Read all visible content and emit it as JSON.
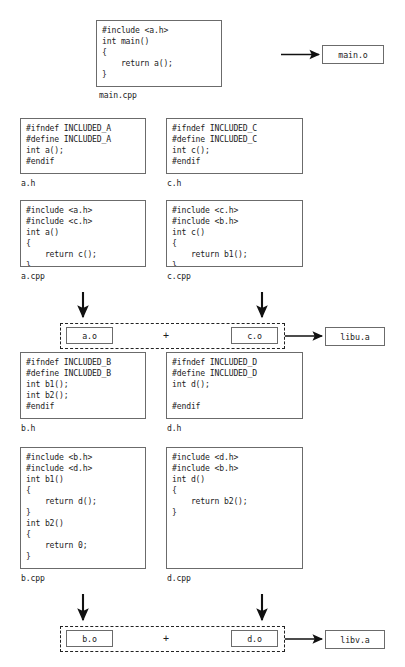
{
  "diagram": {
    "colors": {
      "box_border": "#6b6b6b",
      "text": "#1c1c1c",
      "arrow": "#111111",
      "background": "#ffffff",
      "group_border": "#222222"
    },
    "source_boxes": [
      {
        "id": "main-cpp",
        "caption": "main.cpp",
        "code": "#include <a.h>\nint main()\n{\n    return a();\n}"
      },
      {
        "id": "a-h",
        "caption": "a.h",
        "code": "#ifndef INCLUDED_A\n#define INCLUDED_A\nint a();\n#endif"
      },
      {
        "id": "c-h",
        "caption": "c.h",
        "code": "#ifndef INCLUDED_C\n#define INCLUDED_C\nint c();\n#endif"
      },
      {
        "id": "a-cpp",
        "caption": "a.cpp",
        "code": "#include <a.h>\n#include <c.h>\nint a()\n{\n    return c();\n}"
      },
      {
        "id": "c-cpp",
        "caption": "c.cpp",
        "code": "#include <c.h>\n#include <b.h>\nint c()\n{\n    return b1();\n}"
      },
      {
        "id": "b-h",
        "caption": "b.h",
        "code": "#ifndef INCLUDED_B\n#define INCLUDED_B\nint b1();\nint b2();\n#endif"
      },
      {
        "id": "d-h",
        "caption": "d.h",
        "code": "#ifndef INCLUDED_D\n#define INCLUDED_D\nint d();\n\n#endif"
      },
      {
        "id": "b-cpp",
        "caption": "b.cpp",
        "code": "#include <b.h>\n#include <d.h>\nint b1()\n{\n    return d();\n}\nint b2()\n{\n    return 0;\n}"
      },
      {
        "id": "d-cpp",
        "caption": "d.cpp",
        "code": "#include <d.h>\n#include <b.h>\nint d()\n{\n    return b2();\n}"
      }
    ],
    "object_boxes": [
      {
        "id": "main-o",
        "label": "main.o"
      },
      {
        "id": "a-o",
        "label": "a.o"
      },
      {
        "id": "c-o",
        "label": "c.o"
      },
      {
        "id": "b-o",
        "label": "b.o"
      },
      {
        "id": "d-o",
        "label": "d.o"
      }
    ],
    "library_boxes": [
      {
        "id": "libu-a",
        "label": "libu.a"
      },
      {
        "id": "libv-a",
        "label": "libv.a"
      }
    ],
    "operators": [
      {
        "id": "plus-libu",
        "label": "+"
      },
      {
        "id": "plus-libv",
        "label": "+"
      }
    ]
  }
}
